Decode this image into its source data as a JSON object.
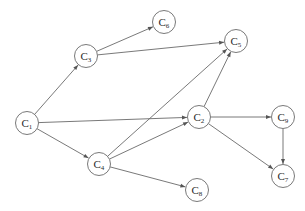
{
  "diagram": {
    "type": "directed-graph",
    "colors": {
      "node_stroke": "#6a6a6a",
      "edge": "#6a6a6a",
      "background": "#ffffff",
      "text": "#2a2a2a"
    },
    "node_radius": 11.5,
    "nodes": [
      {
        "id": "C1",
        "letter": "C",
        "sub": "1",
        "x": 27,
        "y": 123
      },
      {
        "id": "C2",
        "letter": "C",
        "sub": "2",
        "x": 199,
        "y": 117
      },
      {
        "id": "C3",
        "letter": "C",
        "sub": "3",
        "x": 86,
        "y": 56
      },
      {
        "id": "C4",
        "letter": "C",
        "sub": "4",
        "x": 99,
        "y": 164
      },
      {
        "id": "C5",
        "letter": "C",
        "sub": "5",
        "x": 236,
        "y": 41
      },
      {
        "id": "C6",
        "letter": "C",
        "sub": "6",
        "x": 164,
        "y": 22
      },
      {
        "id": "C7",
        "letter": "C",
        "sub": "7",
        "x": 283,
        "y": 176
      },
      {
        "id": "C8",
        "letter": "C",
        "sub": "8",
        "x": 197,
        "y": 190
      },
      {
        "id": "C9",
        "letter": "C",
        "sub": "9",
        "x": 283,
        "y": 117
      }
    ],
    "edges": [
      {
        "from": "C1",
        "to": "C3"
      },
      {
        "from": "C1",
        "to": "C2"
      },
      {
        "from": "C1",
        "to": "C4"
      },
      {
        "from": "C3",
        "to": "C6"
      },
      {
        "from": "C3",
        "to": "C5"
      },
      {
        "from": "C4",
        "to": "C5"
      },
      {
        "from": "C4",
        "to": "C2"
      },
      {
        "from": "C4",
        "to": "C8"
      },
      {
        "from": "C2",
        "to": "C5"
      },
      {
        "from": "C2",
        "to": "C9"
      },
      {
        "from": "C2",
        "to": "C7"
      },
      {
        "from": "C9",
        "to": "C7"
      }
    ]
  }
}
